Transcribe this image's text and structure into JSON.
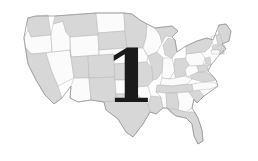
{
  "image": {
    "title": "United States map with numeral overlay",
    "width": 258,
    "height": 161,
    "background_color": "#ffffff"
  },
  "map": {
    "name": "united-states-map",
    "description": "Outline map of the contiguous United States with state borders",
    "state_fill_gray": "#d7d7d7",
    "state_fill_white": "#fbfbfb",
    "border_color": "#b9b9b9",
    "coast_outline_color": "#9a9a9a",
    "regions": [
      {
        "id": "washington",
        "label": "WA",
        "shade": "gray"
      },
      {
        "id": "oregon",
        "label": "OR",
        "shade": "white"
      },
      {
        "id": "california",
        "label": "CA",
        "shade": "gray"
      },
      {
        "id": "nevada",
        "label": "NV",
        "shade": "white"
      },
      {
        "id": "idaho",
        "label": "ID",
        "shade": "white"
      },
      {
        "id": "montana",
        "label": "MT",
        "shade": "gray"
      },
      {
        "id": "wyoming",
        "label": "WY",
        "shade": "white"
      },
      {
        "id": "utah",
        "label": "UT",
        "shade": "gray"
      },
      {
        "id": "arizona",
        "label": "AZ",
        "shade": "white"
      },
      {
        "id": "colorado",
        "label": "CO",
        "shade": "gray"
      },
      {
        "id": "new-mexico",
        "label": "NM",
        "shade": "gray"
      },
      {
        "id": "north-dakota",
        "label": "ND",
        "shade": "white"
      },
      {
        "id": "south-dakota",
        "label": "SD",
        "shade": "gray"
      },
      {
        "id": "nebraska",
        "label": "NE",
        "shade": "white"
      },
      {
        "id": "kansas",
        "label": "KS",
        "shade": "gray"
      },
      {
        "id": "oklahoma",
        "label": "OK",
        "shade": "white"
      },
      {
        "id": "texas",
        "label": "TX",
        "shade": "gray"
      },
      {
        "id": "minnesota",
        "label": "MN",
        "shade": "gray"
      },
      {
        "id": "iowa",
        "label": "IA",
        "shade": "white"
      },
      {
        "id": "missouri",
        "label": "MO",
        "shade": "gray"
      },
      {
        "id": "arkansas",
        "label": "AR",
        "shade": "white"
      },
      {
        "id": "louisiana",
        "label": "LA",
        "shade": "gray"
      },
      {
        "id": "wisconsin",
        "label": "WI",
        "shade": "white"
      },
      {
        "id": "illinois",
        "label": "IL",
        "shade": "gray"
      },
      {
        "id": "michigan",
        "label": "MI",
        "shade": "gray"
      },
      {
        "id": "indiana",
        "label": "IN",
        "shade": "white"
      },
      {
        "id": "ohio",
        "label": "OH",
        "shade": "gray"
      },
      {
        "id": "kentucky",
        "label": "KY",
        "shade": "white"
      },
      {
        "id": "tennessee",
        "label": "TN",
        "shade": "gray"
      },
      {
        "id": "mississippi",
        "label": "MS",
        "shade": "white"
      },
      {
        "id": "alabama",
        "label": "AL",
        "shade": "gray"
      },
      {
        "id": "georgia",
        "label": "GA",
        "shade": "white"
      },
      {
        "id": "florida",
        "label": "FL",
        "shade": "gray"
      },
      {
        "id": "south-carolina",
        "label": "SC",
        "shade": "gray"
      },
      {
        "id": "north-carolina",
        "label": "NC",
        "shade": "white"
      },
      {
        "id": "virginia",
        "label": "VA",
        "shade": "gray"
      },
      {
        "id": "west-virginia",
        "label": "WV",
        "shade": "white"
      },
      {
        "id": "pennsylvania",
        "label": "PA",
        "shade": "white"
      },
      {
        "id": "new-york",
        "label": "NY",
        "shade": "gray"
      },
      {
        "id": "maine",
        "label": "ME",
        "shade": "gray"
      },
      {
        "id": "vermont",
        "label": "VT",
        "shade": "white"
      },
      {
        "id": "new-hampshire",
        "label": "NH",
        "shade": "gray"
      },
      {
        "id": "massachusetts",
        "label": "MA",
        "shade": "gray"
      },
      {
        "id": "connecticut",
        "label": "CT",
        "shade": "white"
      },
      {
        "id": "rhode-island",
        "label": "RI",
        "shade": "gray"
      },
      {
        "id": "new-jersey",
        "label": "NJ",
        "shade": "gray"
      },
      {
        "id": "delaware",
        "label": "DE",
        "shade": "white"
      },
      {
        "id": "maryland",
        "label": "MD",
        "shade": "gray"
      }
    ]
  },
  "overlay": {
    "numeral": "1",
    "color": "#1a1a1a"
  }
}
